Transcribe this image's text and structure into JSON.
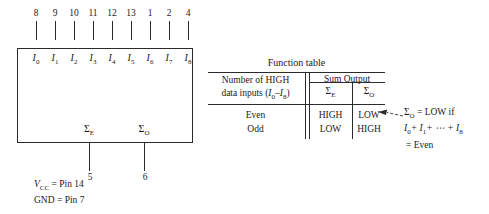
{
  "device": {
    "pins": [
      {
        "num": "8",
        "input": "I",
        "sub": "0"
      },
      {
        "num": "9",
        "input": "I",
        "sub": "1"
      },
      {
        "num": "10",
        "input": "I",
        "sub": "2"
      },
      {
        "num": "11",
        "input": "I",
        "sub": "3"
      },
      {
        "num": "12",
        "input": "I",
        "sub": "4"
      },
      {
        "num": "13",
        "input": "I",
        "sub": "5"
      },
      {
        "num": "1",
        "input": "I",
        "sub": "6"
      },
      {
        "num": "2",
        "input": "I",
        "sub": "7"
      },
      {
        "num": "4",
        "input": "I",
        "sub": "8"
      }
    ],
    "outputs": [
      {
        "symbol": "Σ",
        "sub": "E",
        "pin": "5"
      },
      {
        "symbol": "Σ",
        "sub": "O",
        "pin": "6"
      }
    ],
    "supply": {
      "vcc_label": "V",
      "vcc_sub": "CC",
      "vcc_value": "= Pin 14",
      "gnd": "GND = Pin 7"
    }
  },
  "function_table": {
    "title": "Function table",
    "left_header_line1": "Number of HIGH",
    "left_header_line2a": "data inputs (",
    "left_header_line2b": "I",
    "left_header_line2sub1": "0",
    "left_header_line2c": "–",
    "left_header_line2d": "I",
    "left_header_line2sub2": "8",
    "left_header_line2e": ")",
    "sum_output_header": "Sum Output",
    "col_sigma_e": "Σ",
    "col_sigma_e_sub": "E",
    "col_sigma_o": "Σ",
    "col_sigma_o_sub": "O",
    "rows": [
      {
        "condition": "Even",
        "sigma_e": "HIGH",
        "sigma_o": "LOW"
      },
      {
        "condition": "Odd",
        "sigma_e": "LOW",
        "sigma_o": "HIGH"
      }
    ]
  },
  "callout": {
    "line1_sym": "Σ",
    "line1_sub": "O",
    "line1_rest": "= LOW if",
    "line2": "I",
    "line2_sub1": "0",
    "line2_b": "+ I",
    "line2_sub2": "1",
    "line2_c": "+ ⋯ + I",
    "line2_sub3": "8",
    "line3": "= Even"
  },
  "colors": {
    "ink": "#1a1a1a",
    "line": "#2b2b2b",
    "background": "#ffffff"
  }
}
